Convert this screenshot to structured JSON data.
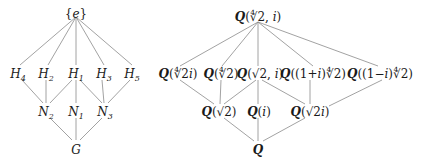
{
  "left_lattice": {
    "title": "Subgroup lattice of G",
    "nodes": [
      {
        "id": "e",
        "label": "{e}",
        "x": 76,
        "y": 14
      },
      {
        "id": "H4",
        "base": "H",
        "sub": "4",
        "x": 18,
        "y": 74
      },
      {
        "id": "H2",
        "base": "H",
        "sub": "2",
        "x": 46,
        "y": 74
      },
      {
        "id": "H1",
        "base": "H",
        "sub": "1",
        "x": 76,
        "y": 74
      },
      {
        "id": "H3",
        "base": "H",
        "sub": "3",
        "x": 104,
        "y": 74
      },
      {
        "id": "H5",
        "base": "H",
        "sub": "5",
        "x": 132,
        "y": 74
      },
      {
        "id": "N2",
        "base": "N",
        "sub": "2",
        "x": 46,
        "y": 112
      },
      {
        "id": "N1",
        "base": "N",
        "sub": "1",
        "x": 76,
        "y": 112
      },
      {
        "id": "N3",
        "base": "N",
        "sub": "3",
        "x": 105,
        "y": 112
      },
      {
        "id": "G",
        "label": "G",
        "x": 76,
        "y": 150
      }
    ],
    "edges": [
      [
        "e",
        "H4"
      ],
      [
        "e",
        "H2"
      ],
      [
        "e",
        "H1"
      ],
      [
        "e",
        "H3"
      ],
      [
        "e",
        "H5"
      ],
      [
        "H4",
        "N2"
      ],
      [
        "H2",
        "N2"
      ],
      [
        "H1",
        "N2"
      ],
      [
        "H1",
        "N1"
      ],
      [
        "H1",
        "N3"
      ],
      [
        "H3",
        "N3"
      ],
      [
        "H5",
        "N3"
      ],
      [
        "N2",
        "G"
      ],
      [
        "N1",
        "G"
      ],
      [
        "N3",
        "G"
      ]
    ]
  },
  "right_lattice": {
    "title": "Intermediate field lattice",
    "nodes": [
      {
        "id": "top",
        "label": "Q(∜2, i)",
        "x": 258,
        "y": 17
      },
      {
        "id": "a",
        "label": "Q(∜2i)",
        "x": 178,
        "y": 74
      },
      {
        "id": "b",
        "label": "Q(∜2)",
        "x": 221,
        "y": 74
      },
      {
        "id": "c",
        "label": "Q(√2, i)",
        "x": 260,
        "y": 74
      },
      {
        "id": "d",
        "label": "Q((1+i)∜2)",
        "x": 313,
        "y": 74
      },
      {
        "id": "f",
        "label": "Q((1−i)∜2)",
        "x": 380,
        "y": 74
      },
      {
        "id": "g",
        "label": "Q(√2)",
        "x": 219,
        "y": 112
      },
      {
        "id": "h",
        "label": "Q(i)",
        "x": 259,
        "y": 112
      },
      {
        "id": "k",
        "label": "Q(√2i)",
        "x": 310,
        "y": 112
      },
      {
        "id": "Q",
        "label": "Q",
        "x": 258,
        "y": 150
      }
    ],
    "edges": [
      [
        "top",
        "a"
      ],
      [
        "top",
        "b"
      ],
      [
        "top",
        "c"
      ],
      [
        "top",
        "d"
      ],
      [
        "top",
        "f"
      ],
      [
        "a",
        "g"
      ],
      [
        "b",
        "g"
      ],
      [
        "c",
        "g"
      ],
      [
        "c",
        "h"
      ],
      [
        "c",
        "k"
      ],
      [
        "d",
        "k"
      ],
      [
        "f",
        "k"
      ],
      [
        "g",
        "Q"
      ],
      [
        "h",
        "Q"
      ],
      [
        "k",
        "Q"
      ]
    ]
  }
}
